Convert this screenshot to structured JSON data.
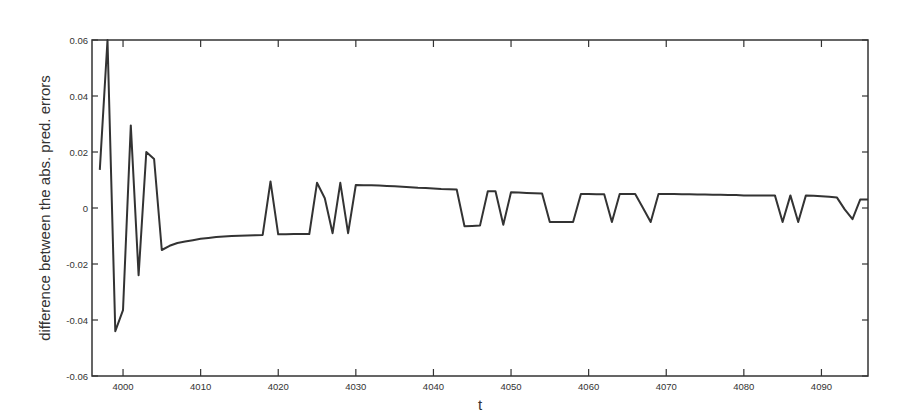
{
  "chart_data": {
    "type": "line",
    "title": "",
    "xlabel": "t",
    "ylabel": "difference between the abs. pred. errors",
    "xlim": [
      3996,
      4096
    ],
    "ylim": [
      -0.06,
      0.06
    ],
    "grid": false,
    "legend": null,
    "x_ticks": [
      4000,
      4010,
      4020,
      4030,
      4040,
      4050,
      4060,
      4070,
      4080,
      4090
    ],
    "x_tick_labels": [
      "4000",
      "4010",
      "4020",
      "4030",
      "4040",
      "4050",
      "4060",
      "4070",
      "4080",
      "4090"
    ],
    "y_ticks": [
      0.06,
      0.04,
      0.02,
      0,
      -0.02,
      -0.04,
      -0.06
    ],
    "y_tick_labels": [
      "0.06",
      "0.04",
      "0.02",
      "0",
      "-0.02",
      "-0.04",
      "-0.06"
    ],
    "line_color": "#333333",
    "series": [
      {
        "name": "difference",
        "x": [
          3997,
          3998,
          3999,
          4000,
          4001,
          4002,
          4003,
          4004,
          4005,
          4006,
          4007,
          4008,
          4009,
          4010,
          4011,
          4012,
          4013,
          4014,
          4015,
          4016,
          4017,
          4018,
          4019,
          4020,
          4021,
          4022,
          4023,
          4024,
          4025,
          4026,
          4027,
          4028,
          4029,
          4030,
          4031,
          4032,
          4033,
          4034,
          4035,
          4036,
          4037,
          4038,
          4039,
          4040,
          4041,
          4042,
          4043,
          4044,
          4045,
          4046,
          4047,
          4048,
          4049,
          4050,
          4051,
          4052,
          4053,
          4054,
          4055,
          4056,
          4057,
          4058,
          4059,
          4060,
          4061,
          4062,
          4063,
          4064,
          4065,
          4066,
          4067,
          4068,
          4069,
          4070,
          4071,
          4072,
          4073,
          4074,
          4075,
          4076,
          4077,
          4078,
          4079,
          4080,
          4081,
          4082,
          4083,
          4084,
          4085,
          4086,
          4087,
          4088,
          4089,
          4090,
          4091,
          4092,
          4093,
          4094,
          4095,
          4096
        ],
        "values": [
          0.0136,
          0.06,
          -0.044,
          -0.0365,
          0.0295,
          -0.024,
          0.02,
          0.0175,
          -0.015,
          -0.0135,
          -0.0125,
          -0.012,
          -0.0115,
          -0.011,
          -0.0107,
          -0.0104,
          -0.0102,
          -0.01,
          -0.0099,
          -0.0098,
          -0.0097,
          -0.0096,
          0.0095,
          -0.0094,
          -0.0094,
          -0.0093,
          -0.0093,
          -0.0093,
          0.009,
          0.0035,
          -0.009,
          0.009,
          -0.009,
          0.0082,
          0.0081,
          0.0081,
          0.008,
          0.0079,
          0.0078,
          0.0076,
          0.0074,
          0.0072,
          0.0071,
          0.007,
          0.0068,
          0.0067,
          0.0066,
          -0.0065,
          -0.0064,
          -0.0063,
          0.006,
          0.006,
          -0.006,
          0.0056,
          0.0055,
          0.0054,
          0.0053,
          0.0052,
          -0.005,
          -0.005,
          -0.005,
          -0.005,
          0.005,
          0.005,
          0.0049,
          0.0049,
          -0.005,
          0.005,
          0.005,
          0.005,
          0.0,
          -0.005,
          0.005,
          0.005,
          0.005,
          0.0049,
          0.0049,
          0.0048,
          0.0048,
          0.0047,
          0.0047,
          0.0046,
          0.0046,
          0.0045,
          0.0045,
          0.0045,
          0.0045,
          0.0045,
          -0.005,
          0.0045,
          -0.005,
          0.0045,
          0.0044,
          0.0042,
          0.004,
          0.0037,
          -0.0005,
          -0.004,
          0.003,
          0.003
        ]
      }
    ]
  }
}
